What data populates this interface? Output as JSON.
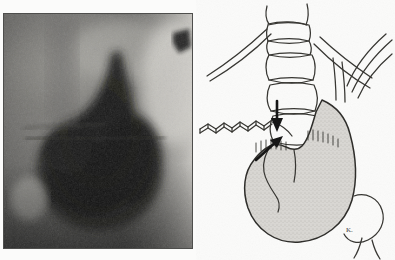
{
  "figure": {
    "type": "medical-figure",
    "layout": "two-panel",
    "background_color": "#fbfbfa",
    "panels": [
      {
        "id": "radiograph",
        "label": "",
        "kind": "grayscale-radiograph",
        "modality": "barium-contrast-radiograph",
        "x": 3,
        "y": 13,
        "width": 190,
        "height": 236,
        "border_color": "#5f5f5d",
        "tone_dark": "#1b1b1a",
        "tone_mid": "#6f6f6d",
        "tone_light": "#c9c8c4",
        "features": [
          "barium-filled-gastric-pouch",
          "soft-tissue-shadow",
          "diaphragm-contour",
          "dark-notch-upper-right"
        ]
      },
      {
        "id": "line-drawing",
        "label": "",
        "kind": "line-drawing-diagram",
        "x": 196,
        "y": 0,
        "width": 199,
        "height": 260,
        "ink_color": "#2b2b29",
        "fill_color": "#d7d5d1",
        "signature": "K.",
        "structures": [
          {
            "name": "vertebral-column",
            "count": 5,
            "description": "stacked vertebral bodies with disc spaces"
          },
          {
            "name": "rib-left",
            "description": "curved rib line descending to the left"
          },
          {
            "name": "esophagus-crura-lines",
            "description": "crossing curved lines at upper right"
          },
          {
            "name": "stomach-fundus",
            "description": "stippled shaded gastric pouch"
          },
          {
            "name": "duodenal-bulb",
            "description": "curved outline at lower right"
          },
          {
            "name": "serrated-marker-line",
            "description": "hatched line entering from the left"
          }
        ],
        "arrows": [
          {
            "id": "arrow-upper",
            "points_to": "hiatal-region",
            "direction": "down"
          },
          {
            "id": "arrow-lower",
            "points_to": "gastroesophageal-junction",
            "direction": "up-right"
          }
        ]
      }
    ]
  }
}
